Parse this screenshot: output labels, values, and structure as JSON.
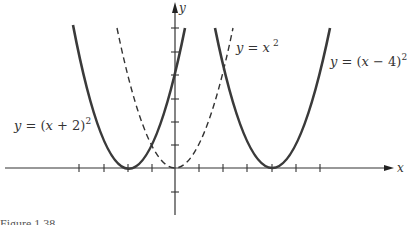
{
  "figure": {
    "caption": "Figure 1.38",
    "axes": {
      "x_label": "x",
      "y_label": "y"
    },
    "curves": [
      {
        "id": "shift-left",
        "equation": "y = (x + 2)²",
        "label_text": "y = (x + 2)",
        "exponent": "2",
        "style": "solid",
        "vertex": [
          -2,
          0
        ]
      },
      {
        "id": "base",
        "equation": "y = x²",
        "label_text": "y = x",
        "exponent": "2",
        "style": "dashed",
        "vertex": [
          0,
          0
        ]
      },
      {
        "id": "shift-right",
        "equation": "y = (x − 4)²",
        "label_text": "y = (x − 4)",
        "exponent": "2",
        "style": "solid",
        "vertex": [
          4,
          0
        ]
      }
    ],
    "x_ticks": [
      -4,
      -3,
      -2,
      -1,
      1,
      2,
      3,
      4,
      5,
      6
    ],
    "y_ticks": [
      -1,
      1,
      2,
      3,
      4,
      5,
      6
    ],
    "colors": {
      "curve": "#3a3a3a",
      "axis": "#333333"
    }
  }
}
